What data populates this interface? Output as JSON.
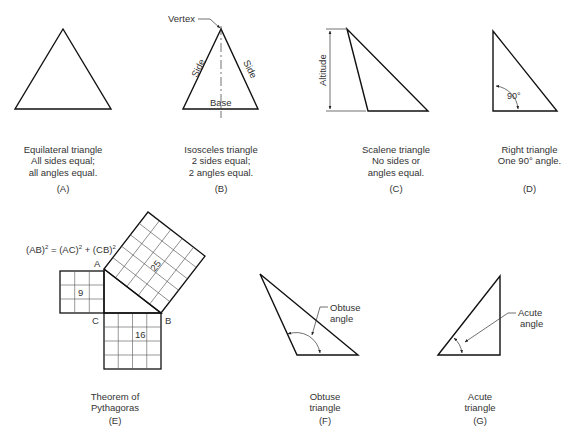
{
  "panels": [
    {
      "id": "A",
      "label": "(A)",
      "caption": [
        "Equilateral triangle",
        "All sides equal;",
        "all angles equal."
      ]
    },
    {
      "id": "B",
      "label": "(B)",
      "caption": [
        "Isosceles triangle",
        "2 sides equal;",
        "2 angles equal."
      ],
      "annotations": {
        "vertex": "Vertex",
        "side_left": "Side",
        "side_right": "Side",
        "base": "Base"
      }
    },
    {
      "id": "C",
      "label": "(C)",
      "caption": [
        "Scalene triangle",
        "No sides or",
        "angles equal."
      ],
      "annotations": {
        "altitude": "Altitude"
      }
    },
    {
      "id": "D",
      "label": "(D)",
      "caption": [
        "Right triangle",
        "One 90° angle."
      ],
      "annotations": {
        "angle": "90°"
      }
    },
    {
      "id": "E",
      "label": "(E)",
      "caption": [
        "Theorem of",
        "Pythagoras"
      ],
      "annotations": {
        "formula_ab": "(AB)",
        "formula_eq": " = (AC)",
        "formula_plus": " + (CB)",
        "sup": "2",
        "point_a": "A",
        "point_b": "B",
        "point_c": "C",
        "square_ac": "9",
        "square_cb": "16",
        "square_ab": "25"
      }
    },
    {
      "id": "F",
      "label": "(F)",
      "caption": [
        "Obtuse",
        "triangle"
      ],
      "annotations": {
        "angle_line1": "Obtuse",
        "angle_line2": "angle"
      }
    },
    {
      "id": "G",
      "label": "(G)",
      "caption": [
        "Acute",
        "triangle"
      ],
      "annotations": {
        "angle_line1": "Acute",
        "angle_line2": "angle"
      }
    }
  ]
}
